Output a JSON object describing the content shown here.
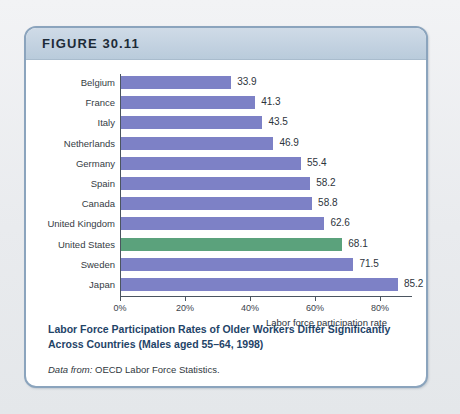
{
  "figure": {
    "header_label": "FIGURE 30.11",
    "caption": "Labor Force Participation Rates of Older Workers Differ Significantly Across Countries (Males aged 55–64, 1998)",
    "source_lead": "Data from:",
    "source_text": " OECD Labor Force Statistics."
  },
  "colors": {
    "bar": "#7d81c6",
    "highlight_bar": "#5ba27c",
    "frame_border": "#8ba4bd",
    "header_band": "#c2d1e0",
    "caption_text": "#1f4468",
    "axis": "#4b5560"
  },
  "chart_data": {
    "type": "bar",
    "orientation": "horizontal",
    "title": "Labor Force Participation Rates of Older Workers Differ Significantly Across Countries (Males aged 55–64, 1998)",
    "xlabel": "Labor force participation rate",
    "ylabel": "",
    "xlim": [
      0,
      90
    ],
    "grid": false,
    "legend": false,
    "xtick_labels": [
      "0%",
      "20%",
      "40%",
      "60%",
      "80%"
    ],
    "xtick_values": [
      0,
      20,
      40,
      60,
      80
    ],
    "categories": [
      "Belgium",
      "France",
      "Italy",
      "Netherlands",
      "Germany",
      "Spain",
      "Canada",
      "United Kingdom",
      "United States",
      "Sweden",
      "Japan"
    ],
    "values": [
      33.9,
      41.3,
      43.5,
      46.9,
      55.4,
      58.2,
      58.8,
      62.6,
      68.1,
      71.5,
      85.2
    ],
    "value_labels": [
      "33.9",
      "41.3",
      "43.5",
      "46.9",
      "55.4",
      "58.2",
      "58.8",
      "62.6",
      "68.1",
      "71.5",
      "85.2"
    ],
    "highlighted_category": "United States"
  }
}
